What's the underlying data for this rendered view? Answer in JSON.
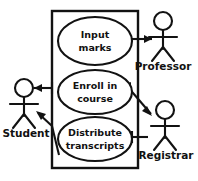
{
  "diagram": {
    "type": "uml-use-case-diagram",
    "background_color": "#ffffff",
    "line_color": "#121212",
    "system_boundary": {
      "label": "",
      "x": 52,
      "y": 11,
      "width": 86,
      "height": 157
    },
    "use_cases": [
      {
        "id": "input-marks",
        "line1": "Input",
        "line2": "marks",
        "cx": 95,
        "cy": 41,
        "rx": 37,
        "ry": 24
      },
      {
        "id": "enroll-in-course",
        "line1": "Enroll in",
        "line2": "course",
        "cx": 95,
        "cy": 92,
        "rx": 37,
        "ry": 22
      },
      {
        "id": "distribute-transcripts",
        "line1": "Distribute",
        "line2": "transcripts",
        "cx": 95,
        "cy": 139,
        "rx": 37,
        "ry": 22
      }
    ],
    "actors": [
      {
        "id": "student",
        "label": "Student",
        "head_cx": 24,
        "head_cy": 88,
        "label_x": 26,
        "label_y": 134
      },
      {
        "id": "professor",
        "label": "Professor",
        "head_cx": 163,
        "head_cy": 21,
        "label_x": 163,
        "label_y": 67
      },
      {
        "id": "registrar",
        "label": "Registrar",
        "head_cx": 165,
        "head_cy": 110,
        "label_x": 166,
        "label_y": 156
      }
    ],
    "associations": [
      {
        "id": "input-marks-to-professor",
        "from": "input-marks",
        "to": "professor",
        "direction": "to-actor"
      },
      {
        "id": "enroll-to-student",
        "from": "enroll-in-course",
        "to": "student",
        "direction": "to-actor"
      },
      {
        "id": "enroll-to-registrar",
        "from": "enroll-in-course",
        "to": "registrar",
        "direction": "to-actor"
      },
      {
        "id": "distribute-to-student",
        "from": "distribute-transcripts",
        "to": "student",
        "direction": "to-actor"
      },
      {
        "id": "registrar-to-distribute",
        "from": "registrar",
        "to": "distribute-transcripts",
        "direction": "to-use-case"
      }
    ]
  }
}
